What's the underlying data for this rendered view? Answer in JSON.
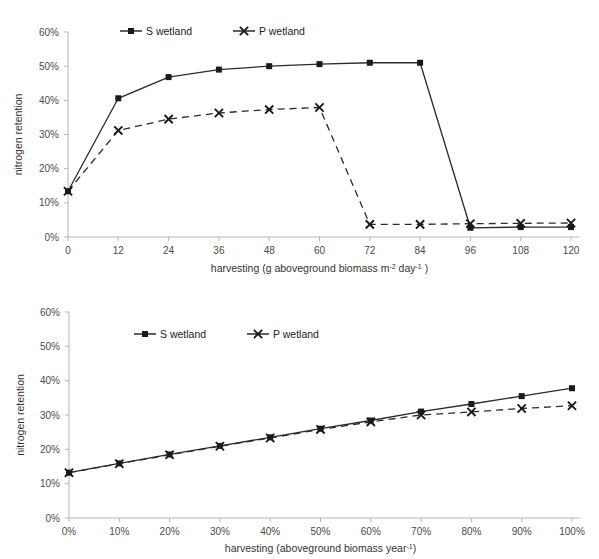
{
  "figure": {
    "panels": [
      "top",
      "bottom"
    ]
  },
  "chart_data": [
    {
      "panel": "top",
      "type": "line",
      "title": "",
      "xlabel": "harvesting (g aboveground biomass m-2 day-1 )",
      "xlabel_parts": {
        "base1": "harvesting (g aboveground biomass m",
        "sup1": "-2",
        "base2": " day",
        "sup2": "-1",
        "base3": " )"
      },
      "ylabel": "nitrogen retention",
      "x": [
        0,
        12,
        24,
        36,
        48,
        60,
        72,
        84,
        96,
        108,
        120
      ],
      "xticklabels": [
        "0",
        "12",
        "24",
        "36",
        "48",
        "60",
        "72",
        "84",
        "108",
        "108",
        "120"
      ],
      "xtick_values": [
        "0",
        "12",
        "24",
        "36",
        "48",
        "60",
        "72",
        "84",
        "96",
        "108",
        "120"
      ],
      "yticklabels": [
        "0%",
        "10%",
        "20%",
        "30%",
        "40%",
        "50%",
        "60%"
      ],
      "ytick_values": [
        0,
        10,
        20,
        30,
        40,
        50,
        60
      ],
      "ylim": [
        0,
        60
      ],
      "xlim": [
        0,
        120
      ],
      "grid": false,
      "legend_position": "top-center",
      "series": [
        {
          "name": "S wetland",
          "marker": "square",
          "linestyle": "solid",
          "color": "#1a1a1a",
          "values": [
            13.4,
            40.6,
            46.8,
            49.0,
            50.0,
            50.6,
            51.0,
            51.0,
            2.7,
            2.9,
            2.9
          ]
        },
        {
          "name": "P wetland",
          "marker": "x",
          "linestyle": "dashed",
          "color": "#1a1a1a",
          "values": [
            13.4,
            31.2,
            34.5,
            36.3,
            37.3,
            37.9,
            3.7,
            3.7,
            3.9,
            4.0,
            4.1
          ]
        }
      ]
    },
    {
      "panel": "bottom",
      "type": "line",
      "title": "",
      "xlabel": "harvesting (aboveground biomass year-1)",
      "xlabel_parts": {
        "base1": "harvesting (aboveground biomass year",
        "sup1": "-1",
        "base2": ")"
      },
      "ylabel": "nitrogen retention",
      "x": [
        0,
        10,
        20,
        30,
        40,
        50,
        60,
        70,
        80,
        90,
        100
      ],
      "xticklabels": [
        "0%",
        "10%",
        "20%",
        "30%",
        "40%",
        "50%",
        "60%",
        "70%",
        "80%",
        "90%",
        "100%"
      ],
      "yticklabels": [
        "0%",
        "10%",
        "20%",
        "30%",
        "40%",
        "50%",
        "60%"
      ],
      "ytick_values": [
        0,
        10,
        20,
        30,
        40,
        50,
        60
      ],
      "ylim": [
        0,
        60
      ],
      "xlim": [
        0,
        100
      ],
      "grid": false,
      "legend_position": "top-center",
      "series": [
        {
          "name": "S wetland",
          "marker": "square",
          "linestyle": "solid",
          "color": "#1a1a1a",
          "values": [
            13.2,
            15.9,
            18.5,
            21.0,
            23.5,
            26.0,
            28.4,
            31.0,
            33.2,
            35.5,
            37.8
          ]
        },
        {
          "name": "P wetland",
          "marker": "x",
          "linestyle": "dashed",
          "color": "#1a1a1a",
          "values": [
            13.2,
            15.8,
            18.4,
            20.9,
            23.3,
            25.8,
            28.0,
            30.0,
            30.9,
            31.9,
            32.7
          ]
        }
      ]
    }
  ]
}
